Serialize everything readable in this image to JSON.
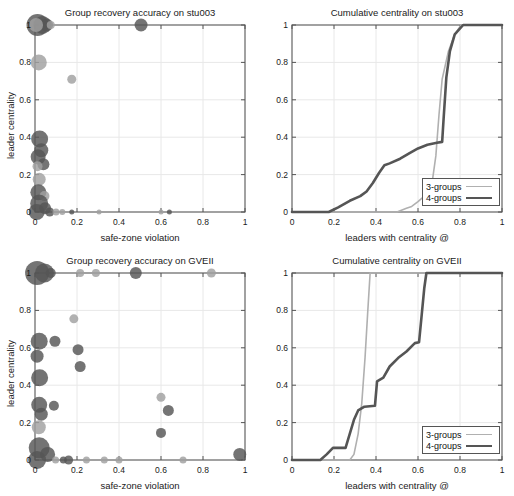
{
  "figure": {
    "width": 514,
    "height": 496,
    "background": "#ffffff"
  },
  "style": {
    "axis_color": "#555555",
    "grid_color": "#e8e8e8",
    "bubble_dark": "#555555",
    "bubble_light": "#a0a0a0",
    "line_light": "#b0b0b0",
    "line_dark": "#555555",
    "text_color": "#1a1a1a"
  },
  "panels": [
    {
      "id": "scatter-stu003",
      "name": "group-recovery-accuracy-stu003",
      "title": "Group recovery accuracy on stu003",
      "xlabel": "safe-zone violation",
      "ylabel": "leader centrality",
      "xticks": [
        "0",
        "0.2",
        "0.4",
        "0.6",
        "0.8",
        "1"
      ],
      "yticks": [
        "0",
        "0.2",
        "0.4",
        "0.6",
        "0.8",
        "1"
      ]
    },
    {
      "id": "cumulative-stu003",
      "name": "cumulative-centrality-stu003",
      "title": "Cumulative centrality on stu003",
      "xlabel": "leaders with centrality @",
      "ylabel": "",
      "xticks": [
        "0",
        "0.2",
        "0.4",
        "0.6",
        "0.8",
        "1"
      ],
      "yticks": [
        "0",
        "0.2",
        "0.4",
        "0.6",
        "0.8",
        "1"
      ]
    },
    {
      "id": "scatter-gveii",
      "name": "group-recovery-accuracy-gveii",
      "title": "Group recovery accuracy on GVEII",
      "xlabel": "safe-zone violation",
      "ylabel": "leader centrality",
      "xticks": [
        "0",
        "0.2",
        "0.4",
        "0.6",
        "0.8",
        "1"
      ],
      "yticks": [
        "0",
        "0.2",
        "0.4",
        "0.6",
        "0.8",
        "1"
      ]
    },
    {
      "id": "cumulative-gveii",
      "name": "cumulative-centrality-gveii",
      "title": "Cumulative centrality on GVEII",
      "xlabel": "leaders with centrality @",
      "ylabel": "",
      "xticks": [
        "0",
        "0.2",
        "0.4",
        "0.6",
        "0.8",
        "1"
      ],
      "yticks": [
        "0",
        "0.2",
        "0.4",
        "0.6",
        "0.8",
        "1"
      ]
    }
  ],
  "legend": {
    "entries": [
      {
        "label": "3-groups",
        "color": "#b0b0b0",
        "width": 1.6
      },
      {
        "label": "4-groups",
        "color": "#555555",
        "width": 2.6
      }
    ]
  },
  "chart_data": [
    {
      "type": "scatter",
      "id": "scatter-stu003",
      "title": "Group recovery accuracy on stu003",
      "xlabel": "safe-zone violation",
      "ylabel": "leader centrality",
      "xlim": [
        0,
        1
      ],
      "ylim": [
        0,
        1
      ],
      "grid": true,
      "note": "bubble chart; r is marker radius in px, c is color group",
      "points": [
        {
          "x": 0.012,
          "y": 1.0,
          "r": 11.0,
          "c": "dark"
        },
        {
          "x": 0.035,
          "y": 1.0,
          "r": 9.0,
          "c": "dark"
        },
        {
          "x": 0.055,
          "y": 1.0,
          "r": 6.5,
          "c": "dark"
        },
        {
          "x": 0.005,
          "y": 1.0,
          "r": 7.0,
          "c": "light"
        },
        {
          "x": 0.075,
          "y": 1.0,
          "r": 4.0,
          "c": "light"
        },
        {
          "x": 0.505,
          "y": 1.0,
          "r": 6.5,
          "c": "dark"
        },
        {
          "x": 0.018,
          "y": 0.8,
          "r": 8.0,
          "c": "light"
        },
        {
          "x": 0.175,
          "y": 0.71,
          "r": 4.5,
          "c": "light"
        },
        {
          "x": 0.022,
          "y": 0.39,
          "r": 8.5,
          "c": "dark"
        },
        {
          "x": 0.03,
          "y": 0.33,
          "r": 7.0,
          "c": "dark"
        },
        {
          "x": 0.015,
          "y": 0.295,
          "r": 7.5,
          "c": "dark"
        },
        {
          "x": 0.04,
          "y": 0.255,
          "r": 6.0,
          "c": "dark"
        },
        {
          "x": 0.012,
          "y": 0.245,
          "r": 5.0,
          "c": "light"
        },
        {
          "x": 0.02,
          "y": 0.175,
          "r": 6.5,
          "c": "light"
        },
        {
          "x": 0.016,
          "y": 0.105,
          "r": 8.0,
          "c": "dark"
        },
        {
          "x": 0.045,
          "y": 0.085,
          "r": 5.0,
          "c": "light"
        },
        {
          "x": 0.02,
          "y": 0.045,
          "r": 9.0,
          "c": "dark"
        },
        {
          "x": 0.048,
          "y": 0.02,
          "r": 6.0,
          "c": "dark"
        },
        {
          "x": 0.008,
          "y": 0.0,
          "r": 8.0,
          "c": "dark"
        },
        {
          "x": 0.07,
          "y": 0.0,
          "r": 4.5,
          "c": "dark"
        },
        {
          "x": 0.1,
          "y": 0.0,
          "r": 3.5,
          "c": "light"
        },
        {
          "x": 0.13,
          "y": 0.0,
          "r": 3.0,
          "c": "light"
        },
        {
          "x": 0.175,
          "y": 0.0,
          "r": 2.5,
          "c": "dark"
        },
        {
          "x": 0.305,
          "y": 0.0,
          "r": 2.5,
          "c": "light"
        },
        {
          "x": 0.6,
          "y": 0.0,
          "r": 2.5,
          "c": "light"
        },
        {
          "x": 0.64,
          "y": 0.0,
          "r": 2.5,
          "c": "dark"
        }
      ]
    },
    {
      "type": "line",
      "id": "cumulative-stu003",
      "title": "Cumulative centrality on stu003",
      "xlabel": "leaders with centrality @",
      "ylabel": "",
      "xlim": [
        0,
        1
      ],
      "ylim": [
        0,
        1
      ],
      "grid": true,
      "legend_position": "lower-right",
      "series": [
        {
          "name": "3-groups",
          "color": "#b0b0b0",
          "width": 1.6,
          "points": [
            [
              0.0,
              0.0
            ],
            [
              0.5,
              0.0
            ],
            [
              0.545,
              0.02
            ],
            [
              0.57,
              0.03
            ],
            [
              0.6,
              0.055
            ],
            [
              0.64,
              0.095
            ],
            [
              0.665,
              0.14
            ],
            [
              0.685,
              0.3
            ],
            [
              0.7,
              0.52
            ],
            [
              0.715,
              0.71
            ],
            [
              0.745,
              0.86
            ],
            [
              0.775,
              0.95
            ],
            [
              0.805,
              1.0
            ],
            [
              1.0,
              1.0
            ]
          ]
        },
        {
          "name": "4-groups",
          "color": "#555555",
          "width": 2.6,
          "points": [
            [
              0.0,
              0.0
            ],
            [
              0.175,
              0.0
            ],
            [
              0.22,
              0.025
            ],
            [
              0.275,
              0.06
            ],
            [
              0.325,
              0.085
            ],
            [
              0.355,
              0.11
            ],
            [
              0.385,
              0.155
            ],
            [
              0.415,
              0.21
            ],
            [
              0.44,
              0.25
            ],
            [
              0.465,
              0.26
            ],
            [
              0.515,
              0.285
            ],
            [
              0.56,
              0.315
            ],
            [
              0.6,
              0.34
            ],
            [
              0.645,
              0.36
            ],
            [
              0.69,
              0.37
            ],
            [
              0.715,
              0.375
            ],
            [
              0.722,
              0.5
            ],
            [
              0.735,
              0.72
            ],
            [
              0.752,
              0.86
            ],
            [
              0.775,
              0.95
            ],
            [
              0.815,
              1.0
            ],
            [
              1.0,
              1.0
            ]
          ]
        }
      ]
    },
    {
      "type": "scatter",
      "id": "scatter-gveii",
      "title": "Group recovery accuracy on GVEII",
      "xlabel": "safe-zone violation",
      "ylabel": "leader centrality",
      "xlim": [
        0,
        1
      ],
      "ylim": [
        0,
        1
      ],
      "grid": true,
      "note": "bubble chart; r is marker radius in px, c is color group",
      "points": [
        {
          "x": 0.01,
          "y": 1.0,
          "r": 12.0,
          "c": "dark"
        },
        {
          "x": 0.045,
          "y": 1.0,
          "r": 9.5,
          "c": "dark"
        },
        {
          "x": 0.075,
          "y": 1.0,
          "r": 5.0,
          "c": "dark"
        },
        {
          "x": 0.215,
          "y": 1.0,
          "r": 4.0,
          "c": "light"
        },
        {
          "x": 0.29,
          "y": 1.0,
          "r": 4.0,
          "c": "light"
        },
        {
          "x": 0.48,
          "y": 1.0,
          "r": 6.0,
          "c": "dark"
        },
        {
          "x": 0.84,
          "y": 1.0,
          "r": 4.5,
          "c": "light"
        },
        {
          "x": 0.185,
          "y": 0.755,
          "r": 4.5,
          "c": "light"
        },
        {
          "x": 0.02,
          "y": 0.635,
          "r": 8.5,
          "c": "dark"
        },
        {
          "x": 0.095,
          "y": 0.635,
          "r": 5.5,
          "c": "dark"
        },
        {
          "x": 0.205,
          "y": 0.59,
          "r": 5.5,
          "c": "dark"
        },
        {
          "x": 0.01,
          "y": 0.555,
          "r": 6.5,
          "c": "dark"
        },
        {
          "x": 0.215,
          "y": 0.5,
          "r": 5.5,
          "c": "dark"
        },
        {
          "x": 0.022,
          "y": 0.44,
          "r": 8.5,
          "c": "dark"
        },
        {
          "x": 0.02,
          "y": 0.295,
          "r": 8.0,
          "c": "dark"
        },
        {
          "x": 0.09,
          "y": 0.29,
          "r": 5.0,
          "c": "dark"
        },
        {
          "x": 0.03,
          "y": 0.245,
          "r": 6.5,
          "c": "dark"
        },
        {
          "x": 0.018,
          "y": 0.175,
          "r": 7.0,
          "c": "light"
        },
        {
          "x": 0.6,
          "y": 0.335,
          "r": 4.5,
          "c": "light"
        },
        {
          "x": 0.635,
          "y": 0.265,
          "r": 5.5,
          "c": "dark"
        },
        {
          "x": 0.6,
          "y": 0.145,
          "r": 5.0,
          "c": "dark"
        },
        {
          "x": 0.02,
          "y": 0.065,
          "r": 10.5,
          "c": "dark"
        },
        {
          "x": 0.06,
          "y": 0.03,
          "r": 7.5,
          "c": "dark"
        },
        {
          "x": 0.01,
          "y": 0.0,
          "r": 9.0,
          "c": "dark"
        },
        {
          "x": 0.098,
          "y": 0.0,
          "r": 3.5,
          "c": "light"
        },
        {
          "x": 0.135,
          "y": 0.0,
          "r": 3.5,
          "c": "dark"
        },
        {
          "x": 0.16,
          "y": 0.0,
          "r": 4.5,
          "c": "dark"
        },
        {
          "x": 0.245,
          "y": 0.0,
          "r": 3.5,
          "c": "light"
        },
        {
          "x": 0.33,
          "y": 0.0,
          "r": 3.5,
          "c": "light"
        },
        {
          "x": 0.4,
          "y": 0.0,
          "r": 3.5,
          "c": "light"
        },
        {
          "x": 0.705,
          "y": 0.0,
          "r": 3.5,
          "c": "light"
        },
        {
          "x": 0.975,
          "y": 0.03,
          "r": 6.5,
          "c": "dark"
        }
      ]
    },
    {
      "type": "line",
      "id": "cumulative-gveii",
      "title": "Cumulative centrality on GVEII",
      "xlabel": "leaders with centrality @",
      "ylabel": "",
      "xlim": [
        0,
        1
      ],
      "ylim": [
        0,
        1
      ],
      "grid": true,
      "legend_position": "lower-right",
      "series": [
        {
          "name": "3-groups",
          "color": "#b0b0b0",
          "width": 1.6,
          "points": [
            [
              0.0,
              0.0
            ],
            [
              0.275,
              0.0
            ],
            [
              0.295,
              0.03
            ],
            [
              0.315,
              0.14
            ],
            [
              0.332,
              0.3
            ],
            [
              0.348,
              0.55
            ],
            [
              0.36,
              0.78
            ],
            [
              0.372,
              1.0
            ],
            [
              1.0,
              1.0
            ]
          ]
        },
        {
          "name": "4-groups",
          "color": "#555555",
          "width": 2.6,
          "points": [
            [
              0.0,
              0.0
            ],
            [
              0.135,
              0.0
            ],
            [
              0.165,
              0.03
            ],
            [
              0.195,
              0.065
            ],
            [
              0.255,
              0.065
            ],
            [
              0.275,
              0.14
            ],
            [
              0.295,
              0.215
            ],
            [
              0.315,
              0.265
            ],
            [
              0.345,
              0.285
            ],
            [
              0.395,
              0.29
            ],
            [
              0.405,
              0.42
            ],
            [
              0.435,
              0.44
            ],
            [
              0.465,
              0.5
            ],
            [
              0.505,
              0.545
            ],
            [
              0.545,
              0.58
            ],
            [
              0.585,
              0.625
            ],
            [
              0.605,
              0.63
            ],
            [
              0.618,
              0.78
            ],
            [
              0.63,
              0.92
            ],
            [
              0.64,
              1.0
            ],
            [
              1.0,
              1.0
            ]
          ]
        }
      ]
    }
  ]
}
